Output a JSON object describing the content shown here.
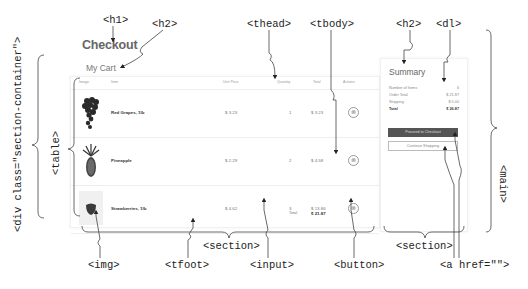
{
  "page": {
    "title": "Checkout",
    "cart_heading": "My Cart"
  },
  "table": {
    "headers": [
      "Image",
      "Item",
      "Unit Price",
      "Quantity",
      "Total",
      "Actions"
    ],
    "rows": [
      {
        "name": "Red Grapes, 1lb",
        "unit_price": "$ 3.23",
        "quantity": "1",
        "total": "$ 3.23",
        "image": "grapes"
      },
      {
        "name": "Pineapple",
        "unit_price": "$ 2.29",
        "quantity": "2",
        "total": "$ 4.58",
        "image": "pineapple"
      },
      {
        "name": "Strawberries, 1lb",
        "unit_price": "$ 4.62",
        "quantity": "3",
        "total": "$ 13.86",
        "image": "strawberry"
      }
    ],
    "footer": {
      "label": "Total",
      "value": "$ 21.87"
    },
    "remove_icon": "⊗"
  },
  "summary": {
    "heading": "Summary",
    "items": [
      {
        "label": "Number of Items",
        "value": "6"
      },
      {
        "label": "Order Total",
        "value": "$ 21.87"
      },
      {
        "label": "Shipping",
        "value": "$ 5.00"
      },
      {
        "label": "Total",
        "value": "$ 26.87"
      }
    ],
    "checkout_button": "Proceed to Checkout",
    "continue_button": "Continue Shopping"
  },
  "annotations": {
    "h1": "<h1>",
    "h2_cart": "<h2>",
    "thead": "<thead>",
    "tbody": "<tbody>",
    "h2_summary": "<h2>",
    "dl": "<dl>",
    "section_container": "<div class=\"section-container\">",
    "table": "<table>",
    "main": "<main>",
    "img": "<img>",
    "tfoot": "<tfoot>",
    "input": "<input>",
    "button": "<button>",
    "section_cart": "<section>",
    "section_summary": "<section>",
    "a": "<a href=\"\">"
  },
  "colors": {
    "primary_button": "#555555",
    "text": "#333333",
    "muted": "#999999"
  }
}
